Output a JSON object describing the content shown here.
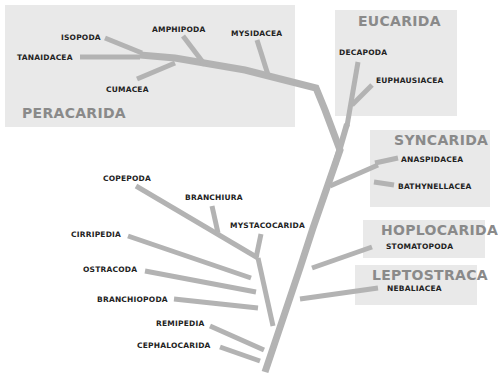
{
  "diagram": {
    "type": "phylogenetic-tree",
    "colors": {
      "branch": "#b3b3b3",
      "box": "#e9e9e9",
      "clade_title": "#8a8a8a",
      "taxon_label": "#222222"
    },
    "clades": {
      "peracarida": {
        "title": "PERACARIDA",
        "taxa": [
          "ISOPODA",
          "TANAIDACEA",
          "CUMACEA",
          "AMPHIPODA",
          "MYSIDACEA"
        ]
      },
      "eucarida": {
        "title": "EUCARIDA",
        "taxa": [
          "DECAPODA",
          "EUPHAUSIACEA"
        ]
      },
      "syncarida": {
        "title": "SYNCARIDA",
        "taxa": [
          "ANASPIDACEA",
          "BATHYNELLACEA"
        ]
      },
      "hoplocarida": {
        "title": "HOPLOCARIDA",
        "taxa": [
          "STOMATOPODA"
        ]
      },
      "leptostraca": {
        "title": "LEPTOSTRACA",
        "taxa": [
          "NEBALIACEA"
        ]
      }
    },
    "ungrouped_taxa": [
      "COPEPODA",
      "BRANCHIURA",
      "MYSTACOCARIDA",
      "CIRRIPEDIA",
      "OSTRACODA",
      "BRANCHIOPODA",
      "REMIPEDIA",
      "CEPHALOCARIDA"
    ]
  }
}
